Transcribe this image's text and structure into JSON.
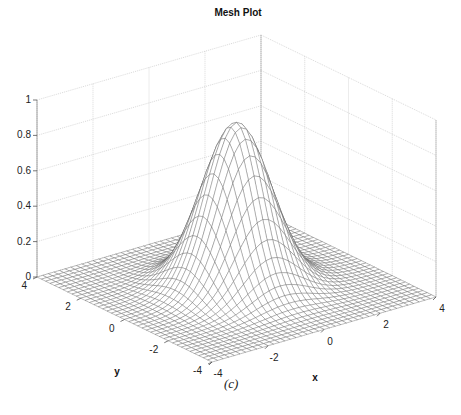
{
  "chart_data": {
    "type": "surface-mesh",
    "title": "Mesh Plot",
    "xlabel": "x",
    "ylabel": "y",
    "zlabel": "",
    "caption": "(c)",
    "function": "z = exp(-(x^2 + y^2)/2) (Gaussian peak, max ≈ 0.93 at origin region)",
    "x_range": [
      -4,
      4
    ],
    "y_range": [
      -4,
      4
    ],
    "zlim": [
      0,
      1
    ],
    "x_ticks": [
      "-4",
      "-2",
      "0",
      "2",
      "4"
    ],
    "y_ticks": [
      "-4",
      "-2",
      "0",
      "2",
      "4"
    ],
    "z_ticks": [
      "0",
      "0.2",
      "0.4",
      "0.6",
      "0.8",
      "1"
    ],
    "grid": true,
    "mesh_resolution": 41,
    "peak_value": 0.93
  }
}
